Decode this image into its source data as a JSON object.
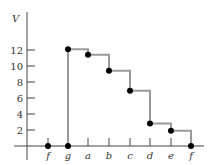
{
  "chart_data": {
    "type": "line",
    "step": true,
    "title": "",
    "ylabel": "V",
    "xlabel": "",
    "ylim": [
      0,
      14
    ],
    "y_ticks": [
      2,
      4,
      6,
      8,
      10,
      12
    ],
    "x_ticks": [
      "f",
      "g",
      "a",
      "b",
      "c",
      "d",
      "e",
      "f"
    ],
    "grid": false,
    "series": [
      {
        "name": "V",
        "points": [
          {
            "x": "f",
            "y": 0
          },
          {
            "x": "g",
            "y": 0
          },
          {
            "x": "g",
            "y": 12.1
          },
          {
            "x": "a",
            "y": 11.4
          },
          {
            "x": "b",
            "y": 9.4
          },
          {
            "x": "c",
            "y": 6.9
          },
          {
            "x": "d",
            "y": 2.8
          },
          {
            "x": "e",
            "y": 1.9
          },
          {
            "x": "f",
            "y": 0
          }
        ]
      }
    ],
    "colors": {
      "line": "#9a9a9a",
      "marker": "#000000",
      "axis": "#444444"
    }
  }
}
